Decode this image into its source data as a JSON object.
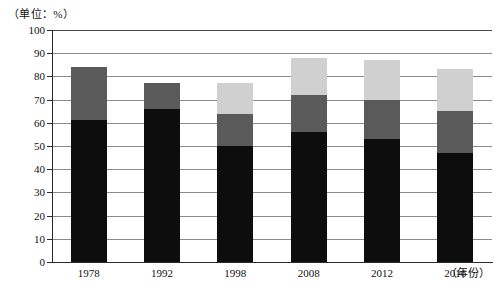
{
  "chart_data": {
    "type": "bar",
    "stacked": true,
    "title": "",
    "subtitle": "",
    "unit_label": "（单位：%）",
    "xlabel": "（年份）",
    "ylabel": "",
    "categories": [
      "1978",
      "1992",
      "1998",
      "2008",
      "2012",
      "2016"
    ],
    "ylim": [
      0,
      100
    ],
    "ytick_labels": [
      "0",
      "10",
      "20",
      "30",
      "40",
      "50",
      "60",
      "70",
      "80",
      "90",
      "100"
    ],
    "ytick_values": [
      0,
      10,
      20,
      30,
      40,
      50,
      60,
      70,
      80,
      90,
      100
    ],
    "grid": true,
    "legend": "none",
    "series": [
      {
        "name": "segment-1",
        "color": "#0d0d0d",
        "values": [
          61,
          66,
          50,
          56,
          53,
          47
        ]
      },
      {
        "name": "segment-2",
        "color": "#5a5a5a",
        "values": [
          23,
          11,
          14,
          16,
          17,
          18
        ]
      },
      {
        "name": "segment-3",
        "color": "#d0d0d0",
        "values": [
          0,
          0,
          13,
          16,
          17,
          18
        ]
      }
    ],
    "cumulative_tops": [
      [
        61,
        84,
        84
      ],
      [
        66,
        77,
        77
      ],
      [
        50,
        64,
        77
      ],
      [
        56,
        72,
        88
      ],
      [
        53,
        70,
        87
      ],
      [
        47,
        65,
        83
      ]
    ],
    "totals": [
      84,
      77,
      77,
      88,
      87,
      83
    ]
  }
}
